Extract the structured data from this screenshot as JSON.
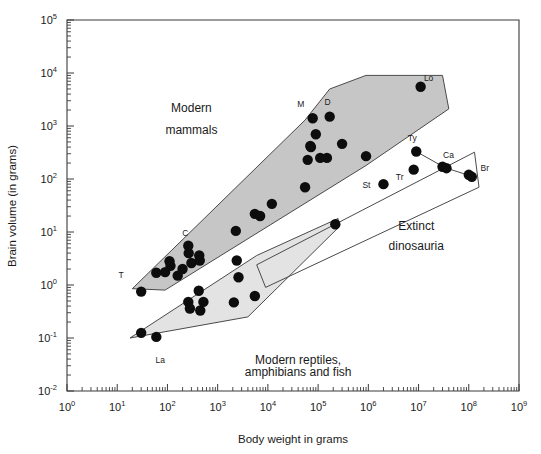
{
  "chart_data": {
    "type": "scatter",
    "title": "",
    "xlabel": "Body weight in grams",
    "ylabel": "Brain volume (in grams)",
    "xscale": "log",
    "yscale": "log",
    "xlim": [
      1,
      1000000000
    ],
    "ylim": [
      0.01,
      100000
    ],
    "grid": false,
    "legend_position": "none",
    "xticklabels": [
      "10^0",
      "10^1",
      "10^2",
      "10^3",
      "10^4",
      "10^5",
      "10^6",
      "10^7",
      "10^8",
      "10^9"
    ],
    "xtickbases": [
      "10",
      "10",
      "10",
      "10",
      "10",
      "10",
      "10",
      "10",
      "10",
      "10"
    ],
    "xtickexps": [
      "0",
      "1",
      "2",
      "3",
      "4",
      "5",
      "6",
      "7",
      "8",
      "9"
    ],
    "yticklabels": [
      "10^-2",
      "10^-1",
      "10^0",
      "10^1",
      "10^2",
      "10^3",
      "10^4",
      "10^5"
    ],
    "ytickbases": [
      "10",
      "10",
      "10",
      "10",
      "10",
      "10",
      "10",
      "10"
    ],
    "ytickexps": [
      "-2",
      "-1",
      "0",
      "1",
      "2",
      "3",
      "4",
      "5"
    ],
    "annotations": [
      {
        "text": "Modern",
        "x": 300,
        "y": 1800,
        "name": "annotation-modern-mammals-line1"
      },
      {
        "text": "mammals",
        "x": 300,
        "y": 700,
        "name": "annotation-modern-mammals-line2"
      },
      {
        "text": "Extinct",
        "x": 9000000,
        "y": 11,
        "name": "annotation-extinct-dinosauria-line1"
      },
      {
        "text": "dinosauria",
        "x": 9000000,
        "y": 4.5,
        "name": "annotation-extinct-dinosauria-line2"
      },
      {
        "text": "Modern reptiles,",
        "x": 40000,
        "y": 0.032,
        "name": "annotation-modern-reptiles-line1"
      },
      {
        "text": "amphibians and fish",
        "x": 40000,
        "y": 0.019,
        "name": "annotation-modern-reptiles-line2"
      }
    ],
    "series": [
      {
        "name": "Modern mammals",
        "region": "mammals",
        "fill_color": "#c6c6c6",
        "points": [
          {
            "x": 30,
            "y": 0.75,
            "label": "T",
            "label_dx": -20,
            "label_dy": -14
          },
          {
            "x": 60,
            "y": 1.7
          },
          {
            "x": 90,
            "y": 1.75
          },
          {
            "x": 110,
            "y": 2.8
          },
          {
            "x": 115,
            "y": 2.3
          },
          {
            "x": 160,
            "y": 1.5
          },
          {
            "x": 200,
            "y": 2.0
          },
          {
            "x": 260,
            "y": 5.5,
            "label": "C",
            "label_dx": -3,
            "label_dy": -10
          },
          {
            "x": 265,
            "y": 4.0
          },
          {
            "x": 300,
            "y": 2.6
          },
          {
            "x": 430,
            "y": 3.6
          },
          {
            "x": 440,
            "y": 2.9
          },
          {
            "x": 2300,
            "y": 10.5
          },
          {
            "x": 5500,
            "y": 22
          },
          {
            "x": 7000,
            "y": 20
          },
          {
            "x": 12000,
            "y": 34
          },
          {
            "x": 55000,
            "y": 70
          },
          {
            "x": 62000,
            "y": 230
          },
          {
            "x": 70000,
            "y": 420
          },
          {
            "x": 72000,
            "y": 400
          },
          {
            "x": 78000,
            "y": 1400,
            "label": "M",
            "label_dx": -12,
            "label_dy": -11
          },
          {
            "x": 90000,
            "y": 700
          },
          {
            "x": 110000,
            "y": 250
          },
          {
            "x": 150000,
            "y": 250
          },
          {
            "x": 170000,
            "y": 1500,
            "label": "D",
            "label_dx": -2,
            "label_dy": -12
          },
          {
            "x": 300000,
            "y": 460
          },
          {
            "x": 900000,
            "y": 270
          },
          {
            "x": 11000000,
            "y": 5500,
            "label": "Lo",
            "label_dx": 8,
            "label_dy": -6
          }
        ]
      },
      {
        "name": "Modern reptiles, amphibians and fish",
        "region": "reptiles",
        "fill_color": "#e3e3e3",
        "points": [
          {
            "x": 30,
            "y": 0.125
          },
          {
            "x": 60,
            "y": 0.105,
            "label": "La",
            "label_dx": 4,
            "label_dy": 26
          },
          {
            "x": 260,
            "y": 0.48
          },
          {
            "x": 280,
            "y": 0.36
          },
          {
            "x": 420,
            "y": 0.78
          },
          {
            "x": 450,
            "y": 0.33
          },
          {
            "x": 520,
            "y": 0.48
          },
          {
            "x": 2100,
            "y": 0.47
          },
          {
            "x": 2400,
            "y": 2.9
          },
          {
            "x": 2600,
            "y": 1.4
          },
          {
            "x": 5500,
            "y": 0.62
          },
          {
            "x": 220000,
            "y": 14
          }
        ]
      },
      {
        "name": "Extinct dinosauria",
        "region": "dinosaurs",
        "fill_color": "none",
        "points": [
          {
            "x": 2000000,
            "y": 80,
            "label": "St",
            "label_dx": -17,
            "label_dy": 4
          },
          {
            "x": 8000000,
            "y": 150,
            "label": "Tr",
            "label_dx": -14,
            "label_dy": 10
          },
          {
            "x": 9000000,
            "y": 330,
            "label": "Ty",
            "label_dx": -4,
            "label_dy": -11
          },
          {
            "x": 30000000,
            "y": 170
          },
          {
            "x": 36000000,
            "y": 160,
            "label": "Ca",
            "label_dx": 2,
            "label_dy": -10
          },
          {
            "x": 100000000,
            "y": 120
          },
          {
            "x": 115000000,
            "y": 110,
            "label": "Br",
            "label_dx": 13,
            "label_dy": -6
          }
        ],
        "connectors": [
          {
            "x1": 9000000,
            "y1": 330,
            "x2": 33000000,
            "y2": 165
          },
          {
            "x1": 36000000,
            "y1": 160,
            "x2": 107000000,
            "y2": 115
          }
        ]
      }
    ],
    "envelopes": [
      {
        "name": "mammals-envelope",
        "style": "filled-dark",
        "vertices": [
          [
            20,
            0.85
          ],
          [
            55000,
            1300
          ],
          [
            170000,
            5000
          ],
          [
            900000,
            9000
          ],
          [
            30000000,
            9000
          ],
          [
            40000000,
            2100
          ],
          [
            900000,
            180
          ],
          [
            90,
            0.8
          ]
        ]
      },
      {
        "name": "reptiles-envelope",
        "style": "filled-light",
        "vertices": [
          [
            18,
            0.1
          ],
          [
            6000,
            3.6
          ],
          [
            250000,
            18
          ],
          [
            250000,
            12
          ],
          [
            4000,
            0.25
          ]
        ]
      },
      {
        "name": "dinosaurs-envelope",
        "style": "outline",
        "vertices": [
          [
            6000,
            2.4
          ],
          [
            130000000,
            320
          ],
          [
            160000000,
            70
          ],
          [
            9000,
            0.9
          ]
        ]
      }
    ]
  }
}
